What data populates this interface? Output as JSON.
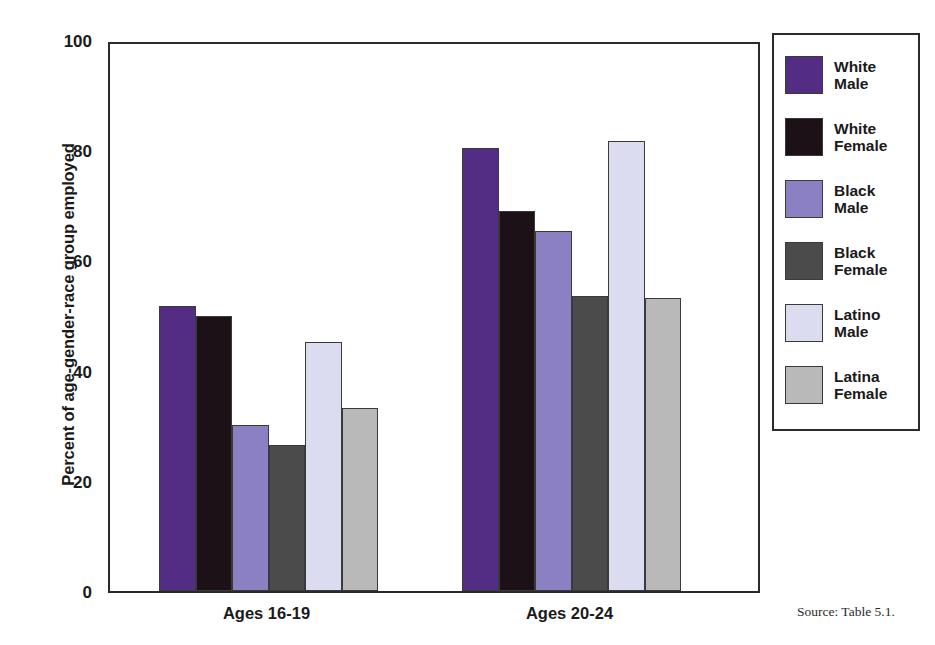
{
  "chart_data": {
    "type": "bar",
    "title": "",
    "subtitle": "",
    "xlabel": "",
    "ylabel": "Percent of age-gender-race group employed",
    "ylim": [
      0,
      100
    ],
    "yticks": [
      0,
      20,
      40,
      60,
      80,
      100
    ],
    "ytick_labels": [
      "0",
      "20",
      "40",
      "60",
      "80",
      "100"
    ],
    "grid": false,
    "legend_position": "right",
    "categories": [
      "Ages 16-19",
      "Ages 20-24"
    ],
    "series": [
      {
        "name": "White Male",
        "color": "#532c83",
        "values": [
          51.8,
          80.4
        ]
      },
      {
        "name": "White Female",
        "color": "#1d1118",
        "values": [
          50.0,
          69.0
        ]
      },
      {
        "name": "Black Male",
        "color": "#8b80c2",
        "values": [
          30.1,
          65.4
        ]
      },
      {
        "name": "Black Female",
        "color": "#4b4b4b",
        "values": [
          26.5,
          53.6
        ]
      },
      {
        "name": "Latino Male",
        "color": "#dcdcf0",
        "values": [
          45.2,
          81.6
        ]
      },
      {
        "name": "Latina Female",
        "color": "#b9b9b9",
        "values": [
          33.3,
          53.2
        ]
      }
    ],
    "legend_labels": [
      {
        "line1": "White",
        "line2": "Male"
      },
      {
        "line1": "White",
        "line2": "Female"
      },
      {
        "line1": "Black",
        "line2": "Male"
      },
      {
        "line1": "Black",
        "line2": "Female"
      },
      {
        "line1": "Latino",
        "line2": "Male"
      },
      {
        "line1": "Latina",
        "line2": "Female"
      }
    ],
    "source_note": "Source: Table 5.1."
  }
}
